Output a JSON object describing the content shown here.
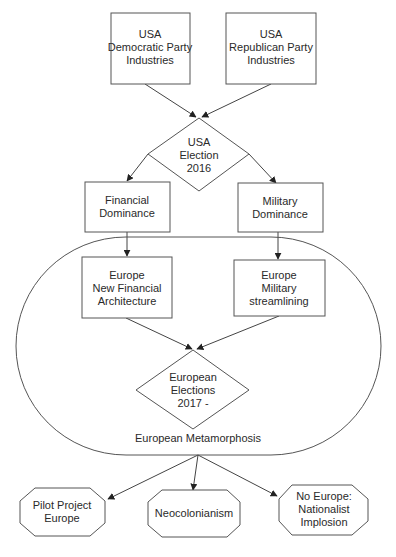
{
  "diagram": {
    "type": "flowchart",
    "colors": {
      "stroke": "#555555",
      "text": "#2a2a2a",
      "background": "#ffffff"
    },
    "nodes": {
      "dem": {
        "shape": "rectangle",
        "lines": [
          "USA",
          "Democratic Party",
          "Industries"
        ]
      },
      "rep": {
        "shape": "rectangle",
        "lines": [
          "USA",
          "Republican Party",
          "Industries"
        ]
      },
      "usa_election": {
        "shape": "diamond",
        "lines": [
          "USA",
          "Election",
          "2016"
        ]
      },
      "fin_dom": {
        "shape": "rectangle",
        "lines": [
          "Financial",
          "Dominance"
        ]
      },
      "mil_dom": {
        "shape": "rectangle",
        "lines": [
          "Military",
          "Dominance"
        ]
      },
      "eu_fin": {
        "shape": "rectangle",
        "lines": [
          "Europe",
          "New Financial",
          "Architecture"
        ]
      },
      "eu_mil": {
        "shape": "rectangle",
        "lines": [
          "Europe",
          "Military",
          "streamlining"
        ]
      },
      "eu_election": {
        "shape": "diamond",
        "lines": [
          "European",
          "Elections",
          "2017 -"
        ]
      },
      "metamorphosis": {
        "shape": "rounded-container",
        "label": "European Metamorphosis"
      },
      "pilot": {
        "shape": "octagon",
        "lines": [
          "Pilot Project",
          "Europe"
        ]
      },
      "neo": {
        "shape": "octagon",
        "lines": [
          "Neocolonianism"
        ]
      },
      "noeu": {
        "shape": "octagon",
        "lines": [
          "No Europe:",
          "Nationalist",
          "Implosion"
        ]
      }
    },
    "edges": [
      {
        "from": "dem",
        "to": "usa_election"
      },
      {
        "from": "rep",
        "to": "usa_election"
      },
      {
        "from": "usa_election",
        "to": "fin_dom"
      },
      {
        "from": "usa_election",
        "to": "mil_dom"
      },
      {
        "from": "fin_dom",
        "to": "eu_fin"
      },
      {
        "from": "mil_dom",
        "to": "eu_mil"
      },
      {
        "from": "eu_fin",
        "to": "eu_election"
      },
      {
        "from": "eu_mil",
        "to": "eu_election"
      },
      {
        "from": "metamorphosis",
        "to": "pilot"
      },
      {
        "from": "metamorphosis",
        "to": "neo"
      },
      {
        "from": "metamorphosis",
        "to": "noeu"
      }
    ]
  },
  "caption": {
    "text": ""
  }
}
